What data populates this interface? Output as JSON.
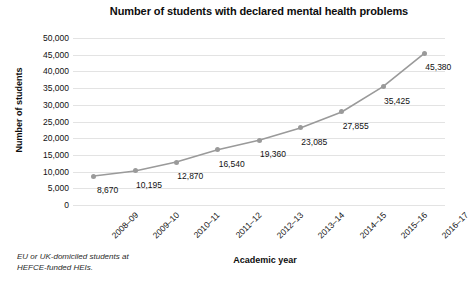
{
  "chart_data": {
    "type": "line",
    "title": "Number of students with declared mental health problems",
    "xlabel": "Academic year",
    "ylabel": "Number of students",
    "categories": [
      "2008–09",
      "2009–10",
      "2010–11",
      "2011–12",
      "2012–13",
      "2013–14",
      "2014–15",
      "2015–16",
      "2016–17"
    ],
    "values": [
      8670,
      10195,
      12870,
      16540,
      19360,
      23085,
      27855,
      35425,
      45380
    ],
    "value_labels": [
      "8,670",
      "10,195",
      "12,870",
      "16,540",
      "19,360",
      "23,085",
      "27,855",
      "35,425",
      "45,380"
    ],
    "ylim": [
      0,
      50000
    ],
    "ytick_values": [
      50000,
      45000,
      40000,
      35000,
      30000,
      25000,
      20000,
      15000,
      10000,
      5000,
      0
    ],
    "ytick_labels": [
      "50,000",
      "45,000",
      "40,000",
      "35,000",
      "30,000",
      "25,000",
      "20,000",
      "15,000",
      "10,000",
      "5,000",
      "0"
    ],
    "grid": "horizontal",
    "legend": "none",
    "series_color": "#9a9a9a",
    "gridline_color": "#e3e3e3",
    "background_color": "#ffffff"
  },
  "footnote": {
    "line1": "EU or UK-domiciled students at",
    "line2": "HEFCE-funded HEIs."
  }
}
